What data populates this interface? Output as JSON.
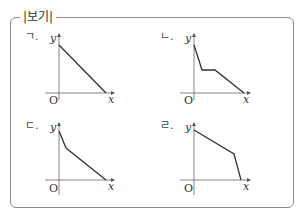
{
  "box": {
    "title": "|보기|",
    "border_color": "#8a8a8a"
  },
  "graphs": [
    {
      "label": "ㄱ.",
      "axis_labels": {
        "origin": "O",
        "x": "x",
        "y": "y"
      },
      "description": "Single straight line decreasing from a point on the y-axis to a point on the x-axis",
      "points": [
        [
          0,
          1.0
        ],
        [
          1.0,
          0
        ]
      ]
    },
    {
      "label": "ㄴ.",
      "axis_labels": {
        "origin": "O",
        "x": "x",
        "y": "y"
      },
      "description": "Steep decrease, then a horizontal segment (constant), then a gradual decrease to the x-axis",
      "points": [
        [
          0,
          1.0
        ],
        [
          0.16,
          0.48
        ],
        [
          0.42,
          0.48
        ],
        [
          1.0,
          0
        ]
      ]
    },
    {
      "label": "ㄷ.",
      "axis_labels": {
        "origin": "O",
        "x": "x",
        "y": "y"
      },
      "description": "Steep decrease, then a gentler linear decrease to the x-axis",
      "points": [
        [
          0,
          1.0
        ],
        [
          0.15,
          0.65
        ],
        [
          1.0,
          0
        ]
      ]
    },
    {
      "label": "ㄹ.",
      "axis_labels": {
        "origin": "O",
        "x": "x",
        "y": "y"
      },
      "description": "Gentle linear decrease, then a steep decrease to the x-axis",
      "points": [
        [
          0,
          1.0
        ],
        [
          0.85,
          0.52
        ],
        [
          1.0,
          0
        ]
      ]
    }
  ],
  "colors": {
    "axis": "#555555",
    "line": "#333333",
    "text": "#333333"
  }
}
